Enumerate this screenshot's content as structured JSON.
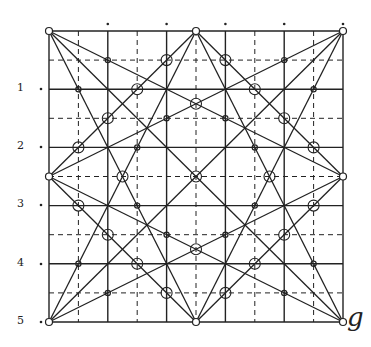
{
  "diagram": {
    "grid": {
      "x0": 49,
      "y0": 31,
      "x1": 343,
      "y1": 322,
      "divisions": 10
    },
    "row_labels": [
      {
        "text": "1",
        "y": 89
      },
      {
        "text": "2",
        "y": 147
      },
      {
        "text": "3",
        "y": 205
      },
      {
        "text": "4",
        "y": 264
      },
      {
        "text": "5",
        "y": 322
      }
    ],
    "corner_label": "g",
    "lines": [
      [
        0,
        0,
        10,
        10
      ],
      [
        10,
        0,
        0,
        10
      ],
      [
        5,
        0,
        10,
        5
      ],
      [
        10,
        5,
        5,
        10
      ],
      [
        5,
        10,
        0,
        5
      ],
      [
        0,
        5,
        5,
        0
      ],
      [
        0,
        0,
        10,
        5
      ],
      [
        0,
        0,
        5,
        10
      ],
      [
        10,
        0,
        0,
        5
      ],
      [
        10,
        0,
        5,
        10
      ],
      [
        0,
        10,
        5,
        0
      ],
      [
        0,
        10,
        10,
        5
      ],
      [
        10,
        10,
        5,
        0
      ],
      [
        10,
        10,
        0,
        5
      ]
    ],
    "small_circles": [
      [
        0,
        0
      ],
      [
        10,
        0
      ],
      [
        0,
        10
      ],
      [
        10,
        10
      ],
      [
        5,
        0
      ],
      [
        0,
        5
      ],
      [
        10,
        5
      ],
      [
        5,
        10
      ]
    ],
    "dots": [
      [
        2,
        1
      ],
      [
        1,
        2
      ],
      [
        4,
        3
      ],
      [
        3,
        4
      ],
      [
        8,
        1
      ],
      [
        9,
        2
      ],
      [
        6,
        3
      ],
      [
        7,
        4
      ],
      [
        2,
        9
      ],
      [
        1,
        8
      ],
      [
        4,
        7
      ],
      [
        3,
        6
      ],
      [
        8,
        9
      ],
      [
        9,
        8
      ],
      [
        6,
        7
      ],
      [
        7,
        6
      ]
    ],
    "large_circles": [
      [
        4,
        1
      ],
      [
        3,
        2
      ],
      [
        2,
        3
      ],
      [
        1,
        4
      ],
      [
        6,
        1
      ],
      [
        7,
        2
      ],
      [
        8,
        3
      ],
      [
        9,
        4
      ],
      [
        1,
        6
      ],
      [
        2,
        7
      ],
      [
        3,
        8
      ],
      [
        4,
        9
      ],
      [
        9,
        6
      ],
      [
        8,
        7
      ],
      [
        7,
        8
      ],
      [
        6,
        9
      ],
      [
        5,
        2.5
      ],
      [
        2.5,
        5
      ],
      [
        7.5,
        5
      ],
      [
        5,
        7.5
      ],
      [
        5,
        5
      ]
    ]
  }
}
